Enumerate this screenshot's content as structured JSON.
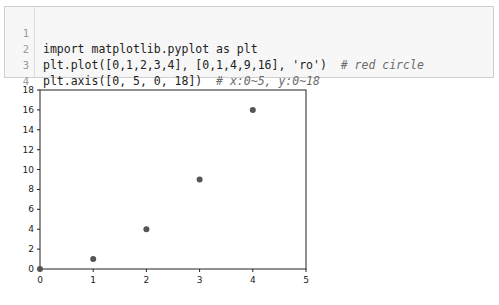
{
  "code_cell": {
    "lines": [
      {
        "number": "1",
        "code": "import matplotlib.pyplot as plt",
        "comment": ""
      },
      {
        "number": "2",
        "code": "plt.plot([0,1,2,3,4], [0,1,4,9,16], 'ro')  ",
        "comment": "# red circle"
      },
      {
        "number": "3",
        "code": "plt.axis([0, 5, 0, 18])  ",
        "comment": "# x:0~5, y:0~18"
      },
      {
        "number": "4",
        "code": "plt.show()",
        "comment": ""
      }
    ]
  },
  "chart_data": {
    "type": "scatter",
    "title": "",
    "xlabel": "",
    "ylabel": "",
    "xlim": [
      0,
      5
    ],
    "ylim": [
      0,
      18
    ],
    "x_ticks": [
      "0",
      "1",
      "2",
      "3",
      "4",
      "5"
    ],
    "y_ticks": [
      "0",
      "2",
      "4",
      "6",
      "8",
      "10",
      "12",
      "14",
      "16",
      "18"
    ],
    "grid": false,
    "legend": null,
    "series": [
      {
        "name": "ro",
        "marker": "circle",
        "color": "#555555",
        "x": [
          0,
          1,
          2,
          3,
          4
        ],
        "y": [
          0,
          1,
          4,
          9,
          16
        ]
      }
    ]
  }
}
